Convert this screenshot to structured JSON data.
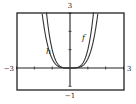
{
  "chart_data": {
    "type": "line",
    "title": "",
    "xlabel": "",
    "ylabel": "",
    "xlim": [
      -3,
      3
    ],
    "ylim": [
      -1,
      3
    ],
    "grid": false,
    "axis_labels": {
      "x_min": "−3",
      "x_max": "3",
      "y_min": "−1",
      "y_max": "3"
    },
    "x_ticks": [
      -3,
      -2,
      -1,
      0,
      1,
      2,
      3
    ],
    "y_ticks": [
      -1,
      0,
      1,
      2,
      3
    ],
    "series": [
      {
        "name": "f",
        "expression": "x^4",
        "label": "f"
      },
      {
        "name": "h",
        "expression": "0.5*x^4",
        "label": "h"
      }
    ],
    "annotations": [
      {
        "text": "h",
        "near_series": "h",
        "side": "left"
      },
      {
        "text": "f",
        "near_series": "f",
        "side": "right"
      }
    ]
  }
}
